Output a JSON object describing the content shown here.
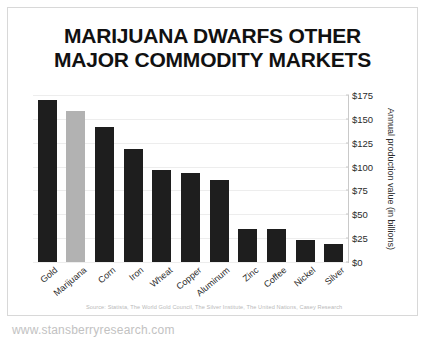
{
  "title": {
    "line1": "MARIJUANA DWARFS OTHER",
    "line2": "MAJOR COMMODITY MARKETS"
  },
  "source": "Source: Statista, The World Gold Council, The Silver Institute, The United Nations, Casey Research",
  "watermark": "www.stansberryresearch.com",
  "colors": {
    "bar": "#1e1e1e",
    "highlight": "#b2b2b2",
    "grid": "#ededed",
    "frame": "#d8d8d8",
    "text": "#1a1a1a",
    "muted": "#bbbbbb"
  },
  "chart_data": {
    "type": "bar",
    "title": "MARIJUANA DWARFS OTHER MAJOR COMMODITY MARKETS",
    "xlabel": "",
    "ylabel": "Annual production value (in billions)",
    "ylim": [
      0,
      175
    ],
    "yticks": [
      0,
      25,
      50,
      75,
      100,
      125,
      150,
      175
    ],
    "ytick_labels": [
      "$0",
      "$25",
      "$50",
      "$75",
      "$100",
      "$125",
      "$150",
      "$175"
    ],
    "grid": true,
    "legend": null,
    "highlight_category": "Marijuana",
    "categories": [
      "Gold",
      "Marijuana",
      "Corn",
      "Iron",
      "Wheat",
      "Copper",
      "Aluminum",
      "Zinc",
      "Coffee",
      "Nickel",
      "Silver"
    ],
    "values": [
      170,
      158,
      141,
      118,
      96,
      93,
      86,
      35,
      35,
      23,
      19
    ],
    "units": "billions of USD"
  }
}
